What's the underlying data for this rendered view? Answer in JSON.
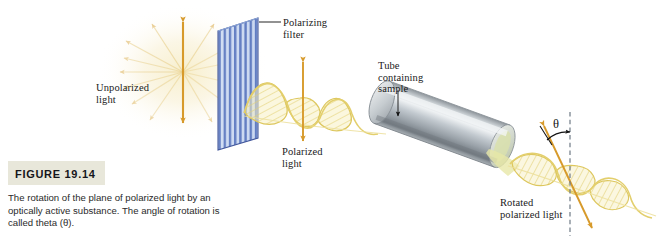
{
  "figure": {
    "number_label": "FIGURE 19.14",
    "caption": "The rotation of the plane of polarized light by an optically active substance. The angle of rotation is called theta (θ).",
    "background_color": "#ffffff",
    "caption_box_color": "#e8e7da"
  },
  "labels": {
    "unpolarized_light": "Unpolarized\nlight",
    "polarizing_filter": "Polarizing\nfilter",
    "tube_containing_sample": "Tube\ncontaining\nsample",
    "polarized_light": "Polarized\nlight",
    "rotated_polarized_light": "Rotated\npolarized light",
    "theta_symbol": "θ"
  },
  "colors": {
    "filter_stripe_dark": "#5d79c0",
    "filter_stripe_light": "#aec2e8",
    "wave_yellow": "#e8d36a",
    "wave_fill": "#f3e9a8",
    "arrow_orange": "#d79a2b",
    "glow_tan": "#f2e4bb",
    "tube_gray_light": "#e6e8ea",
    "tube_gray_mid": "#a9b0b5",
    "tube_gray_dark": "#6f777d",
    "tube_end_tint": "#d8dfa8",
    "dashed_line": "#7a8590",
    "text": "#1a1a1a"
  },
  "elements": {
    "polarizing_filter": "striped-blue-panel",
    "sample_tube": "metallic-cylinder",
    "incoming_beam": "radial-starburst-arrows",
    "polarized_beam": "vertical-plane-sine-wave",
    "rotated_beam": "tilted-plane-sine-wave",
    "angle_indicator": "theta-arc-with-dashed-reference"
  }
}
